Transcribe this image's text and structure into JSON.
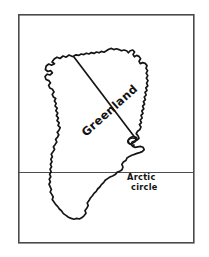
{
  "figure": {
    "kind": "hand-drawn-map",
    "background_color": "#ffffff",
    "frame": {
      "name": "map-border",
      "stroke_color": "#4a4a4a",
      "x": 18,
      "y": 14,
      "width": 176,
      "height": 229
    }
  },
  "map": {
    "region_label": "Greenland",
    "coastline_color": "#151515",
    "region_label_rotation_deg": -42,
    "region_label_x": 86,
    "region_label_y": 137
  },
  "annotations": {
    "arctic_circle": {
      "line_label_1": "Arctic",
      "line_label_2": "circle",
      "line_color": "#3a3a3a",
      "line_y": 172,
      "line_x_start": 18,
      "line_x_end": 194,
      "text_x": 127,
      "text_y_1": 180,
      "text_y_2": 189
    }
  }
}
